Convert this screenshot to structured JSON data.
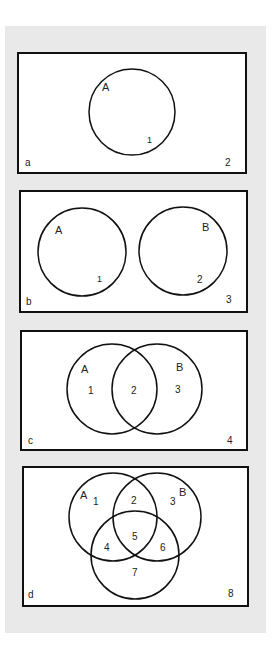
{
  "diagram": {
    "type": "venn-diagram-series",
    "background_color": "#e9e9e9",
    "panels": [
      {
        "id": "a",
        "corner_label": "a",
        "sets": [
          "A"
        ],
        "regions": [
          "1",
          "2"
        ],
        "set_labels": {
          "A": "A"
        }
      },
      {
        "id": "b",
        "corner_label": "b",
        "sets": [
          "A",
          "B"
        ],
        "relationship": "disjoint",
        "regions": [
          "1",
          "2",
          "3"
        ],
        "set_labels": {
          "A": "A",
          "B": "B"
        }
      },
      {
        "id": "c",
        "corner_label": "c",
        "sets": [
          "A",
          "B"
        ],
        "relationship": "overlapping",
        "regions": [
          "1",
          "2",
          "3",
          "4"
        ],
        "set_labels": {
          "A": "A",
          "B": "B"
        }
      },
      {
        "id": "d",
        "corner_label": "d",
        "sets": [
          "A",
          "B",
          "C"
        ],
        "relationship": "three-way-overlapping",
        "regions": [
          "1",
          "2",
          "3",
          "4",
          "5",
          "6",
          "7",
          "8"
        ],
        "set_labels": {
          "A": "A",
          "B": "B"
        }
      }
    ]
  }
}
